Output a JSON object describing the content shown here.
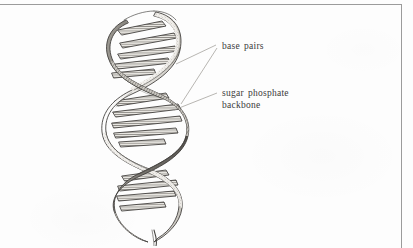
{
  "figure": {
    "style": "pen-and-ink line drawing, scanned textbook page",
    "background_color": "#fdfdfd",
    "ink_color": "#3a3a3a",
    "rule_color": "#9b9b9b"
  },
  "rules": {
    "top_rule_name": "top horizontal rule",
    "right_rule_name": "right vertical rule"
  },
  "art": {
    "helix_name": "dna-double-helix-drawing",
    "strand_count": 2,
    "turns": 4,
    "rung_label": "base pair rung"
  },
  "annotations": [
    {
      "id": "base-pairs",
      "text": "base  pairs",
      "leader_count": 2
    },
    {
      "id": "sugar-phosphate",
      "text": "sugar  phosphate\nbackbone",
      "leader_count": 1
    }
  ]
}
